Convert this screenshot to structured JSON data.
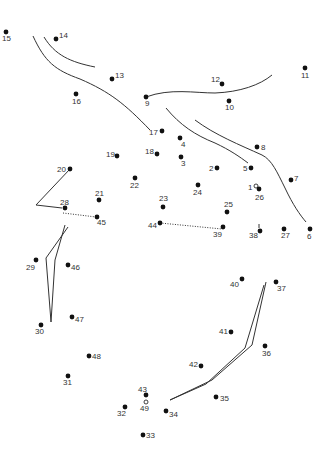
{
  "puzzle": {
    "type": "connect-the-dots",
    "dot_color": "#111111",
    "line_color": "#333333",
    "label_color": "#333333",
    "dots": [
      {
        "n": "1",
        "x": 256,
        "y": 186,
        "lx": 248,
        "ly": 190,
        "hollow": true
      },
      {
        "n": "2",
        "x": 217,
        "y": 168,
        "lx": 209,
        "ly": 171
      },
      {
        "n": "3",
        "x": 181,
        "y": 157,
        "lx": 181,
        "ly": 166
      },
      {
        "n": "4",
        "x": 180,
        "y": 138,
        "lx": 181,
        "ly": 147
      },
      {
        "n": "5",
        "x": 251,
        "y": 168,
        "lx": 243,
        "ly": 171
      },
      {
        "n": "6",
        "x": 310,
        "y": 229,
        "lx": 307,
        "ly": 239
      },
      {
        "n": "7",
        "x": 291,
        "y": 180,
        "lx": 294,
        "ly": 181
      },
      {
        "n": "8",
        "x": 257,
        "y": 147,
        "lx": 261,
        "ly": 150
      },
      {
        "n": "9",
        "x": 146,
        "y": 97,
        "lx": 145,
        "ly": 106
      },
      {
        "n": "10",
        "x": 229,
        "y": 101,
        "lx": 225,
        "ly": 110
      },
      {
        "n": "11",
        "x": 305,
        "y": 68,
        "lx": 301,
        "ly": 78
      },
      {
        "n": "12",
        "x": 222,
        "y": 84,
        "lx": 211,
        "ly": 82
      },
      {
        "n": "13",
        "x": 112,
        "y": 79,
        "lx": 115,
        "ly": 78
      },
      {
        "n": "14",
        "x": 56,
        "y": 39,
        "lx": 59,
        "ly": 38
      },
      {
        "n": "15",
        "x": 6,
        "y": 32,
        "lx": 2,
        "ly": 41
      },
      {
        "n": "16",
        "x": 76,
        "y": 94,
        "lx": 72,
        "ly": 104
      },
      {
        "n": "17",
        "x": 162,
        "y": 131,
        "lx": 149,
        "ly": 135
      },
      {
        "n": "18",
        "x": 157,
        "y": 154,
        "lx": 145,
        "ly": 154
      },
      {
        "n": "19",
        "x": 117,
        "y": 156,
        "lx": 106,
        "ly": 157
      },
      {
        "n": "20",
        "x": 70,
        "y": 169,
        "lx": 57,
        "ly": 172
      },
      {
        "n": "21",
        "x": 99,
        "y": 200,
        "lx": 95,
        "ly": 196
      },
      {
        "n": "22",
        "x": 135,
        "y": 178,
        "lx": 130,
        "ly": 188
      },
      {
        "n": "23",
        "x": 163,
        "y": 207,
        "lx": 159,
        "ly": 201
      },
      {
        "n": "24",
        "x": 198,
        "y": 185,
        "lx": 193,
        "ly": 195
      },
      {
        "n": "25",
        "x": 227,
        "y": 212,
        "lx": 224,
        "ly": 207
      },
      {
        "n": "26",
        "x": 259,
        "y": 189,
        "lx": 255,
        "ly": 200
      },
      {
        "n": "27",
        "x": 284,
        "y": 229,
        "lx": 281,
        "ly": 238
      },
      {
        "n": "28",
        "x": 65,
        "y": 208,
        "lx": 60,
        "ly": 205
      },
      {
        "n": "29",
        "x": 36,
        "y": 260,
        "lx": 26,
        "ly": 270
      },
      {
        "n": "30",
        "x": 41,
        "y": 325,
        "lx": 35,
        "ly": 334
      },
      {
        "n": "31",
        "x": 68,
        "y": 376,
        "lx": 63,
        "ly": 385
      },
      {
        "n": "32",
        "x": 125,
        "y": 407,
        "lx": 117,
        "ly": 416
      },
      {
        "n": "33",
        "x": 143,
        "y": 435,
        "lx": 146,
        "ly": 438
      },
      {
        "n": "34",
        "x": 166,
        "y": 411,
        "lx": 169,
        "ly": 417
      },
      {
        "n": "35",
        "x": 216,
        "y": 397,
        "lx": 220,
        "ly": 401
      },
      {
        "n": "36",
        "x": 265,
        "y": 346,
        "lx": 262,
        "ly": 356
      },
      {
        "n": "37",
        "x": 276,
        "y": 282,
        "lx": 277,
        "ly": 291
      },
      {
        "n": "38",
        "x": 260,
        "y": 231,
        "lx": 249,
        "ly": 238
      },
      {
        "n": "39",
        "x": 223,
        "y": 227,
        "lx": 213,
        "ly": 237
      },
      {
        "n": "40",
        "x": 242,
        "y": 279,
        "lx": 230,
        "ly": 287
      },
      {
        "n": "41",
        "x": 231,
        "y": 332,
        "lx": 219,
        "ly": 334
      },
      {
        "n": "42",
        "x": 201,
        "y": 366,
        "lx": 189,
        "ly": 367
      },
      {
        "n": "43",
        "x": 146,
        "y": 395,
        "lx": 138,
        "ly": 392
      },
      {
        "n": "44",
        "x": 160,
        "y": 223,
        "lx": 148,
        "ly": 228
      },
      {
        "n": "45",
        "x": 97,
        "y": 217,
        "lx": 97,
        "ly": 225
      },
      {
        "n": "46",
        "x": 68,
        "y": 265,
        "lx": 71,
        "ly": 270
      },
      {
        "n": "47",
        "x": 72,
        "y": 317,
        "lx": 75,
        "ly": 322
      },
      {
        "n": "48",
        "x": 89,
        "y": 356,
        "lx": 92,
        "ly": 359
      },
      {
        "n": "49",
        "x": 146,
        "y": 402,
        "lx": 140,
        "ly": 411,
        "hollow": true
      }
    ],
    "guide_strokes": [
      "M 33 36 C 45 62, 55 70, 80 79 C 110 92, 125 104, 150 130",
      "M 44 37 C 55 55, 70 62, 95 67",
      "M 146 97 C 170 88, 195 93, 215 93 C 240 92, 260 85, 272 75",
      "M 166 108 C 180 125, 195 135, 215 143 C 230 150, 240 157, 248 163",
      "M 195 120 C 215 135, 240 145, 262 155 C 272 160, 277 172, 285 188 C 293 205, 300 215, 306 222",
      "M 70 169 L 36 205 L 62 208",
      "M 68 227 L 46 258 L 51 322 L 55 260 L 65 225",
      "M 266 282 L 252 345 L 212 380 L 170 400 L 206 384 L 245 348 L 264 285",
      "M 259 228 L 259 224"
    ],
    "dotted_strokes": [
      "M 63 213 L 96 217",
      "M 160 223 L 222 229"
    ]
  }
}
